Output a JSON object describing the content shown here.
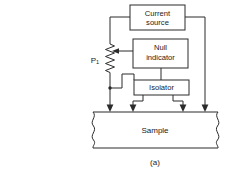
{
  "figure": {
    "caption": "(a)",
    "blocks": [
      {
        "id": "current-source",
        "label_line1": "Current",
        "label_line2": "source"
      },
      {
        "id": "null-indicator",
        "label_line1": "Null",
        "label_line2": "indicator"
      },
      {
        "id": "isolator",
        "label_line1": "Isolator",
        "label_line2": ""
      },
      {
        "id": "sample",
        "label_line1": "Sample",
        "label_line2": ""
      }
    ],
    "components": [
      {
        "id": "potentiometer",
        "label": "P",
        "subscript": "1",
        "symbol": "resistor-with-wiper"
      }
    ],
    "colors": {
      "line": "#2b2b2b",
      "text": "#1a1a1a",
      "background": "#ffffff"
    },
    "probe_arrow_count": 4
  }
}
